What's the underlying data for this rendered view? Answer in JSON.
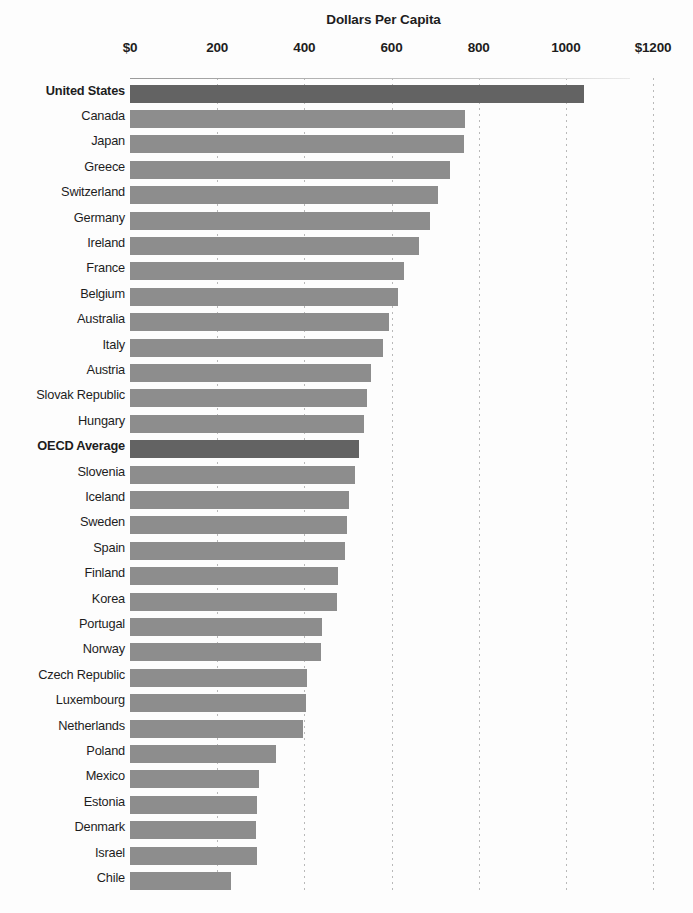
{
  "chart_data": {
    "type": "bar",
    "orientation": "horizontal",
    "title": "Dollars Per Capita",
    "xlabel": "Dollars Per Capita",
    "ylabel": "",
    "xlim": [
      0,
      1200
    ],
    "grid": true,
    "legend": null,
    "tick_labels": [
      "$0",
      "200",
      "400",
      "600",
      "800",
      "1000",
      "$1200"
    ],
    "tick_values": [
      0,
      200,
      400,
      600,
      800,
      1000,
      1200
    ],
    "categories": [
      "United States",
      "Canada",
      "Japan",
      "Greece",
      "Switzerland",
      "Germany",
      "Ireland",
      "France",
      "Belgium",
      "Australia",
      "Italy",
      "Austria",
      "Slovak Republic",
      "Hungary",
      "OECD Average",
      "Slovenia",
      "Iceland",
      "Sweden",
      "Spain",
      "Finland",
      "Korea",
      "Portugal",
      "Norway",
      "Czech Republic",
      "Luxembourg",
      "Netherlands",
      "Poland",
      "Mexico",
      "Estonia",
      "Denmark",
      "Israel",
      "Chile"
    ],
    "values": [
      1041,
      768,
      766,
      734,
      706,
      688,
      663,
      628,
      615,
      594,
      580,
      553,
      543,
      537,
      525,
      516,
      502,
      498,
      493,
      477,
      475,
      440,
      438,
      406,
      404,
      397,
      335,
      296,
      291,
      289,
      291,
      232
    ],
    "highlighted": [
      "United States",
      "OECD Average"
    ],
    "colors": {
      "bar": "#8d8d8d",
      "bar_highlight": "#636363",
      "gridline": "#b9b9b9",
      "text": "#1d1d1d",
      "background": "#fdfdfd"
    }
  }
}
